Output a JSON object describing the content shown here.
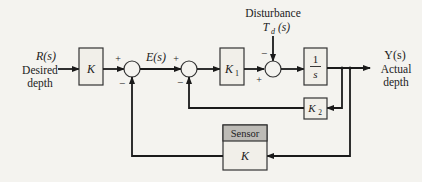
{
  "diagram": {
    "colors": {
      "background": "#f4f3ef",
      "line": "#1a1a1a",
      "block_fill": "#f1efe9",
      "sensor_header": "#bdbbb6"
    },
    "input": {
      "signal": "R(s)",
      "line1": "Desired",
      "line2": "depth"
    },
    "output": {
      "signal": "Y(s)",
      "line1": "Actual",
      "line2": "depth"
    },
    "error_signal": "E(s)",
    "disturbance": {
      "title": "Disturbance",
      "signal": "Td(s)",
      "signal_main": "T",
      "signal_sub": "d",
      "signal_arg": "(s)"
    },
    "blocks": {
      "prefilter": {
        "label": "K"
      },
      "k1": {
        "label": "K",
        "sub": "1"
      },
      "integrator": {
        "numerator": "1",
        "denominator": "s"
      },
      "k2": {
        "label": "K",
        "sub": "2"
      },
      "sensor": {
        "header": "Sensor",
        "label": "K"
      }
    },
    "summing_junctions": {
      "sum1": {
        "plus": "+",
        "minus": "−"
      },
      "sum2": {
        "plus": "+",
        "minus": "−"
      },
      "sum3": {
        "plus": "+",
        "minus": "−"
      }
    }
  }
}
